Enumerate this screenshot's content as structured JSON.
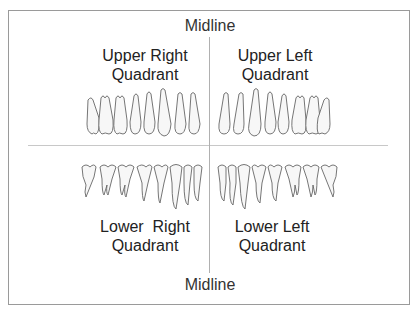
{
  "diagram": {
    "title_top": "Midline",
    "title_bottom": "Midline",
    "quadrants": {
      "upper_right": {
        "line1": "Upper Right",
        "line2": "Quadrant"
      },
      "upper_left": {
        "line1": "Upper Left",
        "line2": "Quadrant"
      },
      "lower_right": {
        "line1": "Lower  Right",
        "line2": "Quadrant"
      },
      "lower_left": {
        "line1": "Lower Left",
        "line2": "Quadrant"
      }
    },
    "teeth_per_quadrant": 8,
    "colors": {
      "frame": "#9a9a9a",
      "divider": "#c8c8c8",
      "tooth_fill": "#f7f7f7",
      "tooth_stroke": "#666666"
    }
  }
}
